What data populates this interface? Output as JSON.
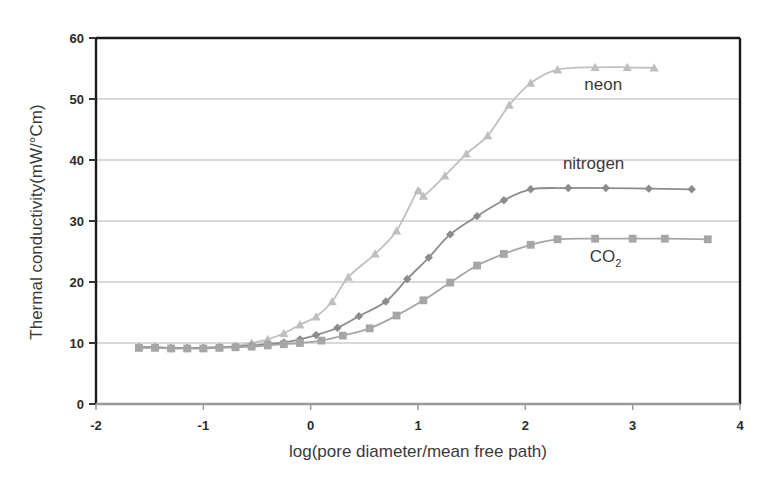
{
  "chart_data": {
    "type": "line",
    "title": "",
    "xlabel": "log(pore diameter/mean free path)",
    "ylabel": "Thermal conductivity(mW/°Cm)",
    "xlim": [
      -2,
      4
    ],
    "ylim": [
      0,
      60
    ],
    "xticks": [
      "-2",
      "-1",
      "0",
      "1",
      "2",
      "3",
      "4"
    ],
    "xtick_values": [
      -2,
      -1,
      0,
      1,
      2,
      3,
      4
    ],
    "yticks": [
      "0",
      "10",
      "20",
      "30",
      "40",
      "50",
      "60"
    ],
    "ytick_values": [
      0,
      10,
      20,
      30,
      40,
      50,
      60
    ],
    "grid": "horizontal",
    "legend_position": "inline-annotations",
    "series": [
      {
        "name": "neon",
        "marker": "triangle",
        "color": "#bfbfbf",
        "label_x": 2.55,
        "label_y": 51.5,
        "points": [
          {
            "x": -1.6,
            "y": 9.3
          },
          {
            "x": -1.45,
            "y": 9.3
          },
          {
            "x": -1.3,
            "y": 9.2
          },
          {
            "x": -1.15,
            "y": 9.2
          },
          {
            "x": -1.0,
            "y": 9.2
          },
          {
            "x": -0.85,
            "y": 9.3
          },
          {
            "x": -0.7,
            "y": 9.5
          },
          {
            "x": -0.55,
            "y": 10.0
          },
          {
            "x": -0.4,
            "y": 10.6
          },
          {
            "x": -0.25,
            "y": 11.6
          },
          {
            "x": -0.1,
            "y": 13.0
          },
          {
            "x": 0.05,
            "y": 14.3
          },
          {
            "x": 0.2,
            "y": 16.8
          },
          {
            "x": 0.35,
            "y": 20.8
          },
          {
            "x": 0.6,
            "y": 24.6
          },
          {
            "x": 0.8,
            "y": 28.4
          },
          {
            "x": 1.0,
            "y": 35.0
          },
          {
            "x": 1.05,
            "y": 34.1
          },
          {
            "x": 1.25,
            "y": 37.4
          },
          {
            "x": 1.45,
            "y": 41.0
          },
          {
            "x": 1.65,
            "y": 44.0
          },
          {
            "x": 1.85,
            "y": 49.0
          },
          {
            "x": 2.05,
            "y": 52.6
          },
          {
            "x": 2.3,
            "y": 54.8
          },
          {
            "x": 2.65,
            "y": 55.2
          },
          {
            "x": 2.95,
            "y": 55.2
          },
          {
            "x": 3.2,
            "y": 55.1
          }
        ]
      },
      {
        "name": "nitrogen",
        "marker": "diamond",
        "color": "#8c8c8c",
        "label_x": 2.35,
        "label_y": 38.6,
        "points": [
          {
            "x": -1.6,
            "y": 9.3
          },
          {
            "x": -1.45,
            "y": 9.3
          },
          {
            "x": -1.3,
            "y": 9.2
          },
          {
            "x": -1.15,
            "y": 9.2
          },
          {
            "x": -1.0,
            "y": 9.2
          },
          {
            "x": -0.85,
            "y": 9.3
          },
          {
            "x": -0.7,
            "y": 9.4
          },
          {
            "x": -0.55,
            "y": 9.6
          },
          {
            "x": -0.4,
            "y": 9.8
          },
          {
            "x": -0.25,
            "y": 10.1
          },
          {
            "x": -0.1,
            "y": 10.6
          },
          {
            "x": 0.05,
            "y": 11.3
          },
          {
            "x": 0.25,
            "y": 12.5
          },
          {
            "x": 0.45,
            "y": 14.4
          },
          {
            "x": 0.7,
            "y": 16.8
          },
          {
            "x": 0.9,
            "y": 20.5
          },
          {
            "x": 1.1,
            "y": 24.0
          },
          {
            "x": 1.3,
            "y": 27.8
          },
          {
            "x": 1.55,
            "y": 30.8
          },
          {
            "x": 1.8,
            "y": 33.4
          },
          {
            "x": 2.05,
            "y": 35.2
          },
          {
            "x": 2.4,
            "y": 35.4
          },
          {
            "x": 2.75,
            "y": 35.4
          },
          {
            "x": 3.15,
            "y": 35.3
          },
          {
            "x": 3.55,
            "y": 35.2
          }
        ]
      },
      {
        "name": "CO2",
        "marker": "square",
        "color": "#a6a6a6",
        "label_x": 2.6,
        "label_y": 23.3,
        "points": [
          {
            "x": -1.6,
            "y": 9.2
          },
          {
            "x": -1.45,
            "y": 9.2
          },
          {
            "x": -1.3,
            "y": 9.1
          },
          {
            "x": -1.15,
            "y": 9.1
          },
          {
            "x": -1.0,
            "y": 9.1
          },
          {
            "x": -0.85,
            "y": 9.2
          },
          {
            "x": -0.7,
            "y": 9.3
          },
          {
            "x": -0.55,
            "y": 9.4
          },
          {
            "x": -0.4,
            "y": 9.6
          },
          {
            "x": -0.25,
            "y": 9.8
          },
          {
            "x": -0.1,
            "y": 10.0
          },
          {
            "x": 0.1,
            "y": 10.4
          },
          {
            "x": 0.3,
            "y": 11.2
          },
          {
            "x": 0.55,
            "y": 12.4
          },
          {
            "x": 0.8,
            "y": 14.5
          },
          {
            "x": 1.05,
            "y": 17.0
          },
          {
            "x": 1.3,
            "y": 19.9
          },
          {
            "x": 1.55,
            "y": 22.7
          },
          {
            "x": 1.8,
            "y": 24.6
          },
          {
            "x": 2.05,
            "y": 26.1
          },
          {
            "x": 2.3,
            "y": 27.0
          },
          {
            "x": 2.65,
            "y": 27.1
          },
          {
            "x": 3.0,
            "y": 27.1
          },
          {
            "x": 3.3,
            "y": 27.1
          },
          {
            "x": 3.7,
            "y": 27.0
          }
        ]
      }
    ]
  },
  "axes": {
    "y_label": "Thermal conductivity(mW/°Cm)",
    "x_label": "log(pore diameter/mean free path)"
  },
  "labels": {
    "neon": "neon",
    "nitrogen": "nitrogen",
    "co2_main": "CO",
    "co2_sub": "2"
  },
  "colors": {
    "neon": "#bfbfbf",
    "nitrogen": "#8c8c8c",
    "co2": "#a6a6a6",
    "frame": "#1a1a1a",
    "grid": "#b3b3b3",
    "text": "#3a3a3a"
  }
}
